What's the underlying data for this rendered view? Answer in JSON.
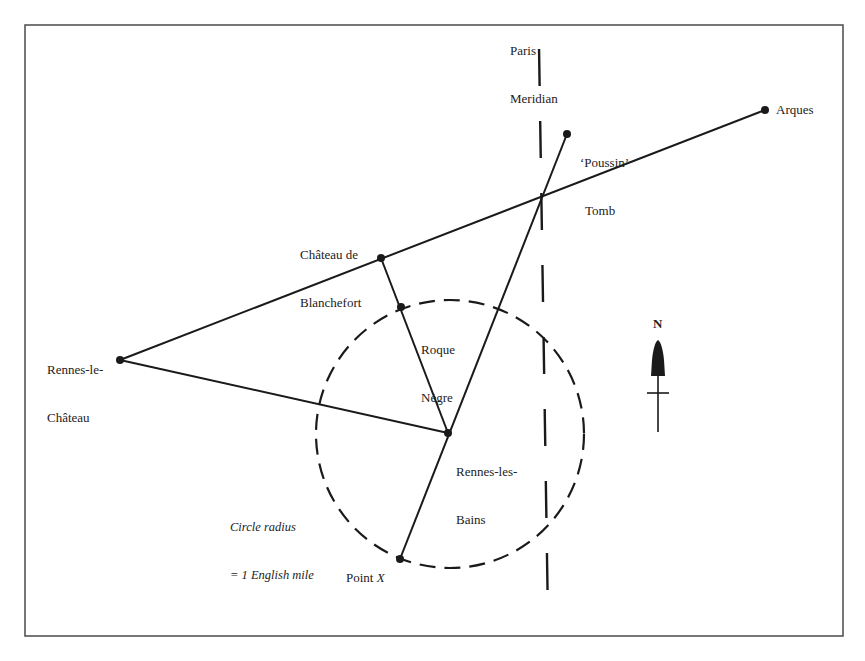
{
  "diagram": {
    "title": "",
    "colors": {
      "background": "#ffffff",
      "ink": "#1a1a1a",
      "frame": "#4a4a4a"
    },
    "places": {
      "arques": {
        "label": "Arques",
        "x": 765,
        "y": 110
      },
      "poussin_tomb": {
        "label_line1": "‘Poussin’",
        "label_line2": "Tomb",
        "x": 567,
        "y": 134
      },
      "chateau_de_blanchefort": {
        "label_line1": "Château de",
        "label_line2": "Blanchefort",
        "x": 381,
        "y": 258
      },
      "roque_negre": {
        "label_line1": "Roque",
        "label_line2": "Nègre",
        "x": 401,
        "y": 307
      },
      "rennes_le_chateau": {
        "label_line1": "Rennes-le-",
        "label_line2": "Château",
        "x": 120,
        "y": 360
      },
      "rennes_les_bains": {
        "label_line1": "Rennes-les-",
        "label_line2": "Bains",
        "x": 448,
        "y": 433
      },
      "point_x": {
        "label_prefix": "Point ",
        "label_var": "X",
        "x": 400,
        "y": 559
      }
    },
    "meridian": {
      "label_line1": "Paris",
      "label_line2": "Meridian"
    },
    "circle": {
      "center": "Rennes-les-Bains",
      "annotation_line1": "Circle radius",
      "annotation_line2": "= 1 English mile"
    },
    "north_arrow": {
      "label": "N"
    }
  }
}
